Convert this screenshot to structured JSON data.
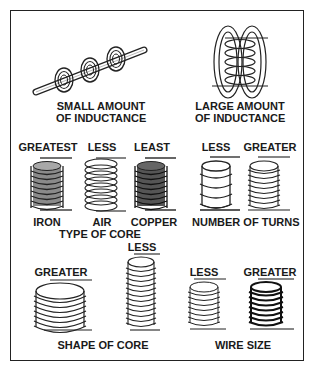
{
  "top_section": {
    "left_caption_line1": "SMALL AMOUNT",
    "left_caption_line2": "OF INDUCTANCE",
    "right_caption_line1": "LARGE AMOUNT",
    "right_caption_line2": "OF INDUCTANCE"
  },
  "type_of_core": {
    "title": "TYPE OF CORE",
    "items": [
      {
        "rank": "GREATEST",
        "label": "IRON",
        "core_color": "#8a8a8a"
      },
      {
        "rank": "LESS",
        "label": "AIR",
        "core_color": "#ffffff"
      },
      {
        "rank": "LEAST",
        "label": "COPPER",
        "core_color": "#555555"
      }
    ]
  },
  "number_of_turns": {
    "title": "NUMBER OF TURNS",
    "items": [
      {
        "rank": "LESS"
      },
      {
        "rank": "GREATER"
      }
    ]
  },
  "shape_of_core": {
    "title": "SHAPE OF CORE",
    "items": [
      {
        "rank": "GREATER"
      },
      {
        "rank": "LESS"
      }
    ]
  },
  "wire_size": {
    "title": "WIRE SIZE",
    "items": [
      {
        "rank": "LESS"
      },
      {
        "rank": "GREATER"
      }
    ]
  }
}
